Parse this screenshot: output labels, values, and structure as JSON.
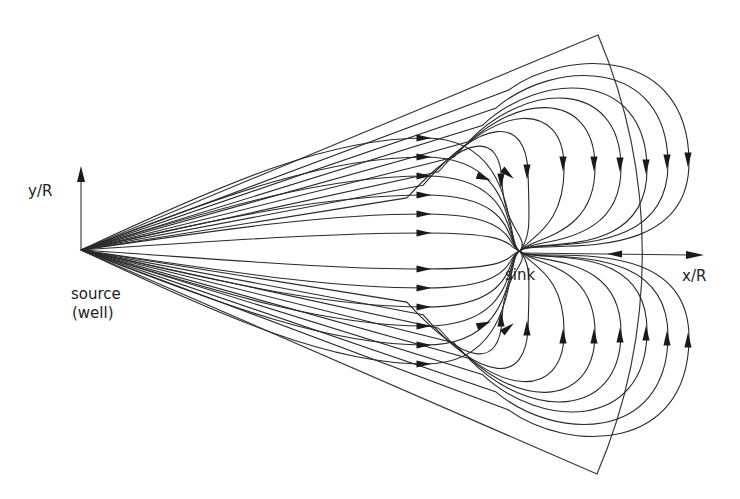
{
  "figure": {
    "type": "streamline-diagram",
    "labels": {
      "y_axis": "y/R",
      "x_axis": "x/R",
      "source": "source",
      "source_sub": "(well)",
      "sink": "sink"
    },
    "colors": {
      "line": "#2a2a2a",
      "background": "#ffffff"
    },
    "geometry": {
      "source_point": [
        81,
        250
      ],
      "sink_point": [
        520,
        251
      ],
      "wedge_top_corner": [
        598,
        35
      ],
      "wedge_bottom_corner": [
        597,
        474
      ],
      "x_axis_end": [
        702,
        255
      ],
      "y_axis_end": [
        81,
        170
      ]
    },
    "streamlines": {
      "count_per_half": 16,
      "straight_to_sink": 6,
      "curving_to_sink_via_arc": 10
    }
  }
}
